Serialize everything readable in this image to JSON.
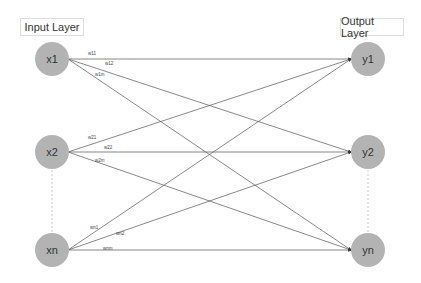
{
  "layers": {
    "input_label": "Input Layer",
    "output_label": "Output Layer"
  },
  "inputs": [
    {
      "label": "x1"
    },
    {
      "label": "x2"
    },
    {
      "label": "xn"
    }
  ],
  "outputs": [
    {
      "label": "y1"
    },
    {
      "label": "y2"
    },
    {
      "label": "yn"
    }
  ],
  "weights": [
    "w11",
    "w12",
    "w1m",
    "w21",
    "w22",
    "w2m",
    "wn1",
    "wn2",
    "wnm"
  ],
  "colors": {
    "node": "#b3b3b3",
    "edge": "#555555",
    "dotted": "#bbbbbb"
  }
}
